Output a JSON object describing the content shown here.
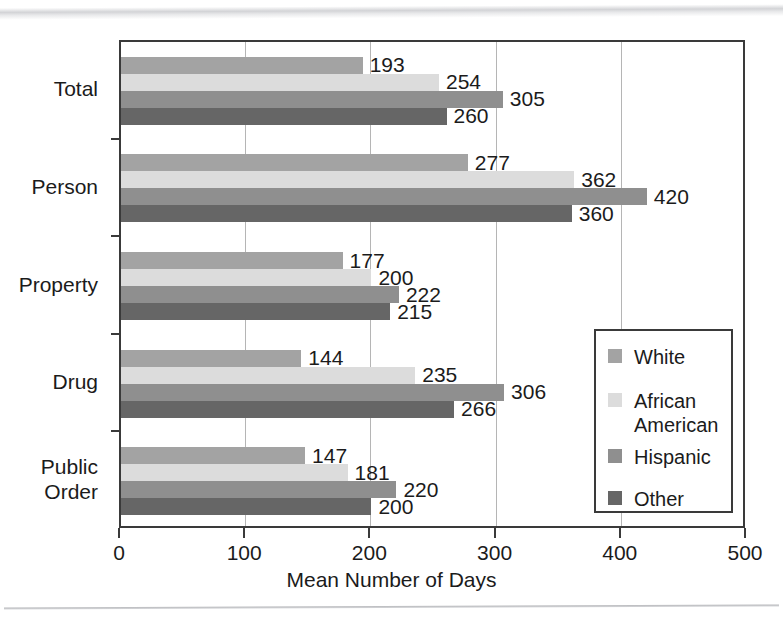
{
  "chart_data": {
    "type": "bar",
    "orientation": "horizontal",
    "title": "",
    "xlabel": "Mean Number of Days",
    "ylabel": "",
    "xlim": [
      0,
      500
    ],
    "xticks": [
      0,
      100,
      200,
      300,
      400,
      500
    ],
    "xtick_labels": [
      "0",
      "100",
      "200",
      "300",
      "400",
      "500"
    ],
    "grid": true,
    "grid_axis": "x",
    "legend_position": "lower right",
    "categories": [
      "Total",
      "Person",
      "Property",
      "Drug",
      "Public Order"
    ],
    "category_labels": [
      "Total",
      "Person",
      "Property",
      "Drug",
      "Public\nOrder"
    ],
    "series": [
      {
        "name": "White",
        "color": "#a3a3a3",
        "values": [
          193,
          277,
          177,
          144,
          147
        ]
      },
      {
        "name": "African American",
        "color": "#dcdcdc",
        "values": [
          254,
          362,
          200,
          235,
          181
        ]
      },
      {
        "name": "Hispanic",
        "color": "#8f8f8f",
        "values": [
          305,
          420,
          222,
          306,
          220
        ]
      },
      {
        "name": "Other",
        "color": "#666666",
        "values": [
          260,
          360,
          215,
          266,
          200
        ]
      }
    ]
  },
  "legend": {
    "entries": [
      {
        "label": "White",
        "color": "#a3a3a3"
      },
      {
        "label": "African\nAmerican",
        "color": "#dcdcdc"
      },
      {
        "label": "Hispanic",
        "color": "#8f8f8f"
      },
      {
        "label": "Other",
        "color": "#666666"
      }
    ]
  },
  "axis": {
    "x_title": "Mean Number of Days"
  },
  "colors": {
    "frame": "#3a3a3a",
    "gridline": "#b5b5b5",
    "text": "#1b1b1b",
    "background": "#ffffff"
  }
}
